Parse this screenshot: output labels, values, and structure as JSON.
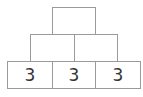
{
  "pyramid": {
    "line_color": "#9a9a9a",
    "rows": [
      {
        "cells": [
          {
            "value": ""
          }
        ]
      },
      {
        "cells": [
          {
            "value": ""
          },
          {
            "value": ""
          }
        ]
      },
      {
        "cells": [
          {
            "value": "3"
          },
          {
            "value": "3"
          },
          {
            "value": "3"
          }
        ]
      }
    ]
  }
}
